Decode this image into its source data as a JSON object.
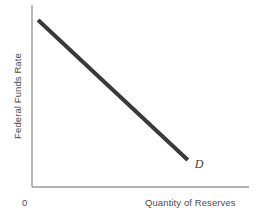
{
  "chart_data": {
    "type": "line",
    "title": "",
    "subtitle": "",
    "xlabel": "Quantity of Reserves",
    "ylabel": "Federal Funds Rate",
    "origin_label": "0",
    "grid": false,
    "legend_position": "none",
    "xlim": [
      0,
      1
    ],
    "ylim": [
      0,
      1
    ],
    "xticks": [],
    "yticks": [],
    "xticklabels": [],
    "yticklabels": [],
    "annotations": [
      {
        "text": "D",
        "style": "italic",
        "x": 0.745,
        "y": 0.125,
        "describes": "demand-for-reserves-curve"
      }
    ],
    "series": [
      {
        "name": "D",
        "label": "Demand for reserves",
        "color": "#3a3a3a",
        "linewidth": 4,
        "x": [
          0.028,
          0.718
        ],
        "y": [
          0.918,
          0.148
        ],
        "points": [
          {
            "x": 0.028,
            "y": 0.918
          },
          {
            "x": 0.718,
            "y": 0.148
          }
        ]
      }
    ]
  },
  "axes": {
    "axis_color": "#9a9a9a",
    "x_axis_label": "Quantity of Reserves",
    "y_axis_label": "Federal Funds Rate",
    "origin": "0"
  },
  "colors": {
    "background": "#ffffff",
    "curve": "#3a3a3a",
    "axis": "#9a9a9a",
    "text": "#4d4d4d"
  }
}
